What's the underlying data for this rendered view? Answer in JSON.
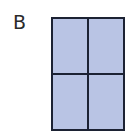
{
  "figure": {
    "label": "B",
    "grid": {
      "rows": 2,
      "columns": 2,
      "fill_color": "#b9c4e4",
      "border_color": "#1c2233",
      "cells": [
        {
          "row": 0,
          "col": 0,
          "shaded": true
        },
        {
          "row": 0,
          "col": 1,
          "shaded": true
        },
        {
          "row": 1,
          "col": 0,
          "shaded": true
        },
        {
          "row": 1,
          "col": 1,
          "shaded": true
        }
      ]
    }
  }
}
